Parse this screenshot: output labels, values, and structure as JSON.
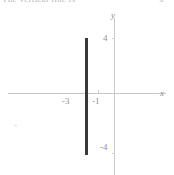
{
  "page": {
    "width": 174,
    "height": 175,
    "background": "#ffffff"
  },
  "header": {
    "left_text_fragment": "The vertical line is",
    "right_text_fragment": "x ="
  },
  "chart_data": {
    "type": "line",
    "title": "",
    "subtitle": "",
    "xlabel": "x",
    "ylabel": "y",
    "xlim": [
      -7,
      2
    ],
    "ylim": [
      -6,
      6
    ],
    "grid": false,
    "legend": null,
    "x_tick_labels": [
      "-3",
      "-1"
    ],
    "x_tick_values": [
      -3,
      -1
    ],
    "y_tick_labels": [
      "4",
      "-4"
    ],
    "y_tick_values": [
      4,
      -4
    ],
    "series": [
      {
        "name": "x = -3",
        "equation": "x = -3",
        "orientation": "vertical",
        "color": "#3a3a3a",
        "linewidth": 3,
        "x": [
          -3,
          -3
        ],
        "y": [
          4,
          -4
        ],
        "points": [
          [
            -3,
            4
          ],
          [
            -3,
            -4
          ]
        ]
      }
    ],
    "axis_color": "#c8c8c8",
    "tick_label_color": "#8f8f8f"
  },
  "labels": {
    "axis_x": "x",
    "axis_y": "y",
    "x_minus_three": "-3",
    "x_minus_one": "-1",
    "y_four": "4",
    "y_minus_four": "-4"
  }
}
